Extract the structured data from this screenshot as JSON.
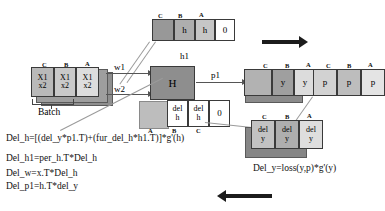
{
  "diagram": {
    "column_labels": [
      "C",
      "B",
      "A"
    ],
    "blocks": {
      "input": {
        "name": "input-batch-block",
        "labels": [
          "C",
          "B",
          "A"
        ],
        "cells": [
          {
            "top": "X1",
            "bottom": "x2"
          },
          {
            "top": "X1",
            "bottom": "x2"
          },
          {
            "top": "X1",
            "bottom": "x2"
          }
        ],
        "caption": "Batch"
      },
      "prev_hidden": {
        "name": "previous-hidden-block",
        "labels": [
          "C",
          "B",
          "A"
        ],
        "cells": [
          "",
          "h",
          "h",
          "0"
        ]
      },
      "hidden": {
        "name": "hidden-state-block",
        "label": "H"
      },
      "del_hidden": {
        "name": "delta-hidden-block",
        "labels": [
          "A",
          "B",
          "C"
        ],
        "cells": [
          "",
          "del h",
          "del h",
          "0"
        ]
      },
      "output_y": {
        "name": "output-y-block",
        "labels": [
          "C",
          "B",
          "A"
        ],
        "cells": [
          "",
          "y",
          "y"
        ]
      },
      "output_p": {
        "name": "prediction-p-block",
        "labels": [
          "C",
          "B",
          "A"
        ],
        "cells": [
          "p",
          "p",
          "p"
        ]
      },
      "del_y": {
        "name": "delta-y-block",
        "labels": [
          "C",
          "B",
          "A"
        ],
        "cells": [
          "del y",
          "del y",
          "del y"
        ]
      }
    },
    "edge_labels": {
      "w1": "w1",
      "w2": "w2",
      "h1": "h1",
      "p1": "p1"
    },
    "formulas": {
      "del_h": "Del_h=[(del_y*p1.T)+(fur_del_h*h1.T)]*g'(h)",
      "del_h1": "Del_h1=per_h.T*Del_h",
      "del_w": "Del_w=x.T*Del_h",
      "del_p1": "Del_p1=h.T*del_y",
      "del_y": "Del_y=loss(y,p)*g'(y)"
    },
    "arrows": {
      "forward": "forward-pass-arrow",
      "backward": "backward-pass-arrow"
    },
    "cell_text": {
      "h": "h",
      "zero": "0",
      "del": "del",
      "y": "y",
      "p": "p",
      "x1": "X1",
      "x2": "x2",
      "H": "H"
    }
  }
}
